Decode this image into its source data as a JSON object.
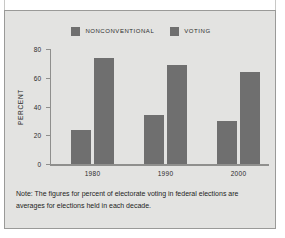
{
  "chart_data": {
    "type": "bar",
    "title": "",
    "xlabel": "",
    "ylabel": "PERCENT",
    "categories": [
      "1980",
      "1990",
      "2000"
    ],
    "series": [
      {
        "name": "NONCONVENTIONAL",
        "values": [
          24,
          34,
          30
        ],
        "color": "#6f6f6f"
      },
      {
        "name": "VOTING",
        "values": [
          74,
          69,
          64
        ],
        "color": "#6f6f6f"
      }
    ],
    "ylim": [
      0,
      80
    ],
    "yticks": [
      0,
      20,
      40,
      60,
      80
    ],
    "ytick_labels": [
      "0",
      "20",
      "40",
      "60",
      "80"
    ],
    "grid": false,
    "legend_position": "top-center"
  },
  "legend": {
    "entries": [
      {
        "label": "NONCONVENTIONAL"
      },
      {
        "label": "VOTING"
      }
    ]
  },
  "note": {
    "text": "Note: The figures for percent of electorate voting in federal elections are averages for elections held in each decade."
  },
  "colors": {
    "bar": "#6f6f6f",
    "panel_background": "#e3e3e1",
    "panel_border": "#9a9a98",
    "axis": "#8f8f8d",
    "text": "#2b2b2b"
  }
}
